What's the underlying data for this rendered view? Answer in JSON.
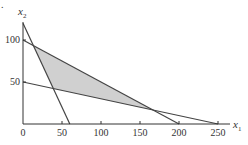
{
  "figure": {
    "marker": "."
  },
  "chart_data": {
    "type": "line",
    "title": "",
    "xlabel": "x1",
    "ylabel": "x2",
    "xlabel_main": "x",
    "xlabel_sub": "1",
    "ylabel_main": "x",
    "ylabel_sub": "2",
    "xlim": [
      0,
      260
    ],
    "ylim": [
      0,
      125
    ],
    "grid": false,
    "x_ticks": [
      0,
      50,
      100,
      150,
      200,
      250
    ],
    "x_tick_labels": [
      "0",
      "50",
      "100",
      "150",
      "200",
      "250"
    ],
    "y_ticks": [
      50,
      100
    ],
    "y_tick_labels": [
      "50",
      "100"
    ],
    "series": [
      {
        "name": "constraint-1",
        "points": [
          [
            0,
            120
          ],
          [
            60,
            0
          ]
        ]
      },
      {
        "name": "constraint-2",
        "points": [
          [
            0,
            100
          ],
          [
            200,
            0
          ]
        ]
      },
      {
        "name": "constraint-3",
        "points": [
          [
            0,
            50
          ],
          [
            250,
            0
          ]
        ]
      }
    ],
    "shaded_region": {
      "name": "feasible-region",
      "vertices": [
        [
          13.3,
          93.3
        ],
        [
          38.9,
          42.2
        ],
        [
          166.7,
          16.7
        ]
      ],
      "fill": "#d0d0d0"
    },
    "colors": {
      "lines": "#444444",
      "axes": "#333333",
      "fill": "#d0d0d0"
    }
  }
}
